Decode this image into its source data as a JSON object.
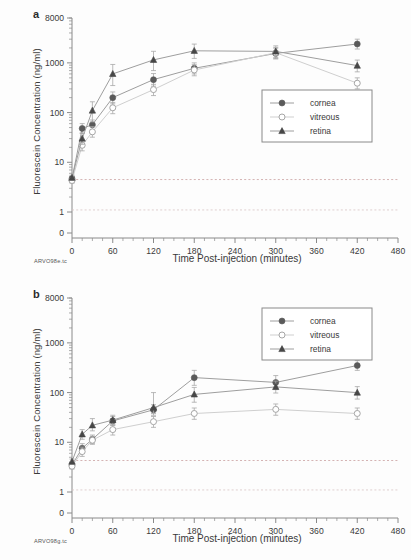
{
  "figure": {
    "panels": [
      {
        "letter": "a",
        "credit": "ARVO98e.tc",
        "legend_position": "center-right"
      },
      {
        "letter": "b",
        "credit": "ARVO98g.tc",
        "legend_position": "top-right"
      }
    ],
    "series_names": [
      "cornea",
      "vitreous",
      "retina"
    ],
    "colors": {
      "cornea": "#5a5a5a",
      "vitreous": "#b9b9b9",
      "retina": "#474747",
      "axis": "#8a8a8a",
      "reference_line": "#c9a0a0"
    }
  },
  "chart_data": [
    {
      "type": "line",
      "panel": "a",
      "title": "",
      "xlabel": "Time Post-injection (minutes)",
      "ylabel": "Fluorescein Concentration (ng/ml)",
      "xlim": [
        0,
        480
      ],
      "xticks": [
        0,
        60,
        120,
        180,
        240,
        300,
        360,
        420,
        480
      ],
      "xtick_labels": [
        "0",
        "60",
        "120",
        "180",
        "240",
        "300",
        "360",
        "420",
        "480"
      ],
      "yscale": "log",
      "ylim": [
        1,
        8000
      ],
      "yticks": [
        1,
        10,
        100,
        1000,
        8000
      ],
      "ytick_labels": [
        "1",
        "10",
        "100",
        "1000",
        "8000"
      ],
      "zero_tick_label": "0",
      "grid": false,
      "legend": [
        "cornea",
        "vitreous",
        "retina"
      ],
      "reference_lines": [
        4.5,
        1.1
      ],
      "x": [
        0,
        15,
        30,
        60,
        120,
        180,
        300,
        420
      ],
      "series": [
        {
          "name": "cornea",
          "marker": "filled-circle",
          "values": [
            4.7,
            48,
            57,
            200,
            460,
            780,
            1550,
            2400
          ],
          "err_low": [
            0.6,
            10,
            12,
            50,
            120,
            180,
            350,
            500
          ],
          "err_high": [
            0.6,
            12,
            14,
            60,
            150,
            220,
            420,
            600
          ]
        },
        {
          "name": "vitreous",
          "marker": "open-circle",
          "values": [
            4.3,
            22,
            41,
            125,
            290,
            720,
            1600,
            390
          ],
          "err_low": [
            0.5,
            5,
            9,
            30,
            70,
            170,
            380,
            90
          ],
          "err_high": [
            0.5,
            6,
            11,
            35,
            80,
            200,
            450,
            110
          ]
        },
        {
          "name": "retina",
          "marker": "filled-triangle",
          "values": [
            4.9,
            30,
            110,
            600,
            1150,
            1750,
            1700,
            880
          ],
          "err_low": [
            0.6,
            7,
            45,
            250,
            450,
            520,
            420,
            220
          ],
          "err_high": [
            0.6,
            9,
            55,
            330,
            560,
            640,
            500,
            260
          ]
        }
      ]
    },
    {
      "type": "line",
      "panel": "b",
      "title": "",
      "xlabel": "Time Post-injection (minutes)",
      "ylabel": "Fluorescein Concentration (ng/ml)",
      "xlim": [
        0,
        480
      ],
      "xticks": [
        0,
        60,
        120,
        180,
        240,
        300,
        360,
        420,
        480
      ],
      "xtick_labels": [
        "0",
        "60",
        "120",
        "180",
        "240",
        "300",
        "360",
        "420",
        "480"
      ],
      "yscale": "log",
      "ylim": [
        1,
        8000
      ],
      "yticks": [
        1,
        10,
        100,
        1000,
        8000
      ],
      "ytick_labels": [
        "1",
        "10",
        "100",
        "1000",
        "8000"
      ],
      "zero_tick_label": "0",
      "grid": false,
      "legend": [
        "cornea",
        "vitreous",
        "retina"
      ],
      "reference_lines": [
        4.3,
        1.1
      ],
      "x": [
        0,
        15,
        30,
        60,
        120,
        180,
        300,
        420
      ],
      "series": [
        {
          "name": "cornea",
          "marker": "filled-circle",
          "values": [
            3.5,
            7.6,
            11.5,
            27,
            45,
            200,
            160,
            350
          ],
          "err_low": [
            0.4,
            1.5,
            2.0,
            5,
            10,
            60,
            45,
            70
          ],
          "err_high": [
            0.4,
            1.8,
            2.5,
            6,
            12,
            80,
            60,
            90
          ]
        },
        {
          "name": "vitreous",
          "marker": "open-circle",
          "values": [
            3.3,
            6.5,
            11.0,
            18,
            26,
            38,
            46,
            38
          ],
          "err_low": [
            0.4,
            1.3,
            1.9,
            4,
            6,
            9,
            11,
            9
          ],
          "err_high": [
            0.4,
            1.5,
            2.2,
            5,
            7,
            11,
            13,
            11
          ]
        },
        {
          "name": "retina",
          "marker": "filled-triangle",
          "values": [
            4.1,
            14.5,
            22,
            28,
            50,
            92,
            130,
            100
          ],
          "err_low": [
            0.5,
            3.0,
            5.0,
            6,
            12,
            28,
            32,
            26
          ],
          "err_high": [
            0.5,
            3.5,
            8.0,
            7,
            50,
            35,
            40,
            32
          ]
        }
      ]
    }
  ]
}
